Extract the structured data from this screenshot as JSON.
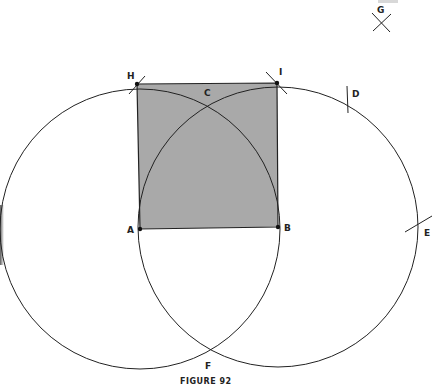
{
  "figure": {
    "caption": "FIGURE 92",
    "shaded_region": "square ABIH",
    "colors": {
      "fill": "#a9a9a9",
      "stroke": "#222222",
      "background": "#ffffff"
    }
  },
  "points": {
    "A": "A",
    "B": "B",
    "C": "C",
    "D": "D",
    "E": "E",
    "F": "F",
    "G": "G",
    "H": "H",
    "I": "I"
  },
  "construction": {
    "circles": [
      "circle centered at A through B",
      "circle centered at B through A"
    ],
    "arcs": [
      "arc through H and B centered at A",
      "arc through I and A centered at B"
    ],
    "tick_marks": [
      "G",
      "H",
      "I",
      "D",
      "E"
    ]
  }
}
